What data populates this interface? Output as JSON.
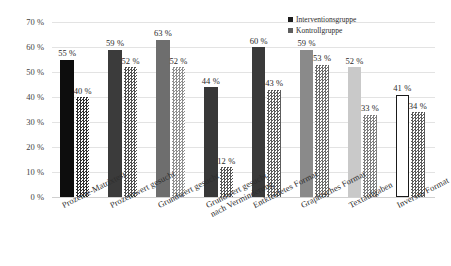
{
  "chart_data": {
    "type": "bar",
    "title": "",
    "subtitle": "",
    "xlabel": "",
    "ylabel": "",
    "ylim": [
      0,
      70
    ],
    "ytick_values": [
      0,
      10,
      20,
      30,
      40,
      50,
      60,
      70
    ],
    "ytick_labels": [
      "0 %",
      "10 %",
      "20 %",
      "30 %",
      "40 %",
      "50 %",
      "60 %",
      "70 %"
    ],
    "grid": true,
    "legend_position": "top-right",
    "categories": [
      "Prozente-Matrixtest",
      "Prozentwert gesucht",
      "Grundwert gesucht",
      "Grundwert gesucht",
      "Entkleidetes Format",
      "Graphisches Format",
      "Textaufgaben",
      "Inverses Format"
    ],
    "category_lines": [
      [
        "Prozente-Matrixtest"
      ],
      [
        "Prozentwert gesucht"
      ],
      [
        "Grundwert gesucht"
      ],
      [
        "Grundwert gesucht",
        "nach Verminderung"
      ],
      [
        "Entkleidetes Format"
      ],
      [
        "Graphisches Format"
      ],
      [
        "Textaufgaben"
      ],
      [
        "Inverses Format"
      ]
    ],
    "series": [
      {
        "name": "Interventionsgruppe",
        "values": [
          55,
          59,
          63,
          44,
          60,
          59,
          52,
          41
        ],
        "value_labels": [
          "55 %",
          "59 %",
          "63 %",
          "44 %",
          "60 %",
          "59 %",
          "52 %",
          "41 %"
        ],
        "colors": [
          "#0d0d0d",
          "#3b3b3b",
          "#6e6e6e",
          "#383838",
          "#3a3a3a",
          "#8a8a8a",
          "#c9c9c9",
          "#ffffff"
        ],
        "outlined": [
          false,
          false,
          false,
          false,
          false,
          false,
          false,
          true
        ]
      },
      {
        "name": "Kontrollgruppe",
        "values": [
          40,
          52,
          52,
          12,
          43,
          53,
          33,
          34
        ],
        "value_labels": [
          "40 %",
          "52 %",
          "52 %",
          "12 %",
          "43 %",
          "53 %",
          "33 %",
          "34 %"
        ],
        "colors": [
          "#2f2f2f",
          "#4e4e4e",
          "#8f8f8f",
          "#555555",
          "#5c5c5c",
          "#6a6a6a",
          "#7d7d7d",
          "#5a5a5a"
        ],
        "hatched": [
          true,
          true,
          true,
          true,
          true,
          true,
          true,
          true
        ]
      }
    ]
  },
  "legend": {
    "items": [
      {
        "label": "Interventionsgruppe",
        "swatch": "interventionsgruppe-swatch"
      },
      {
        "label": "Kontrollgruppe",
        "swatch": "kontrollgruppe-swatch"
      }
    ]
  }
}
